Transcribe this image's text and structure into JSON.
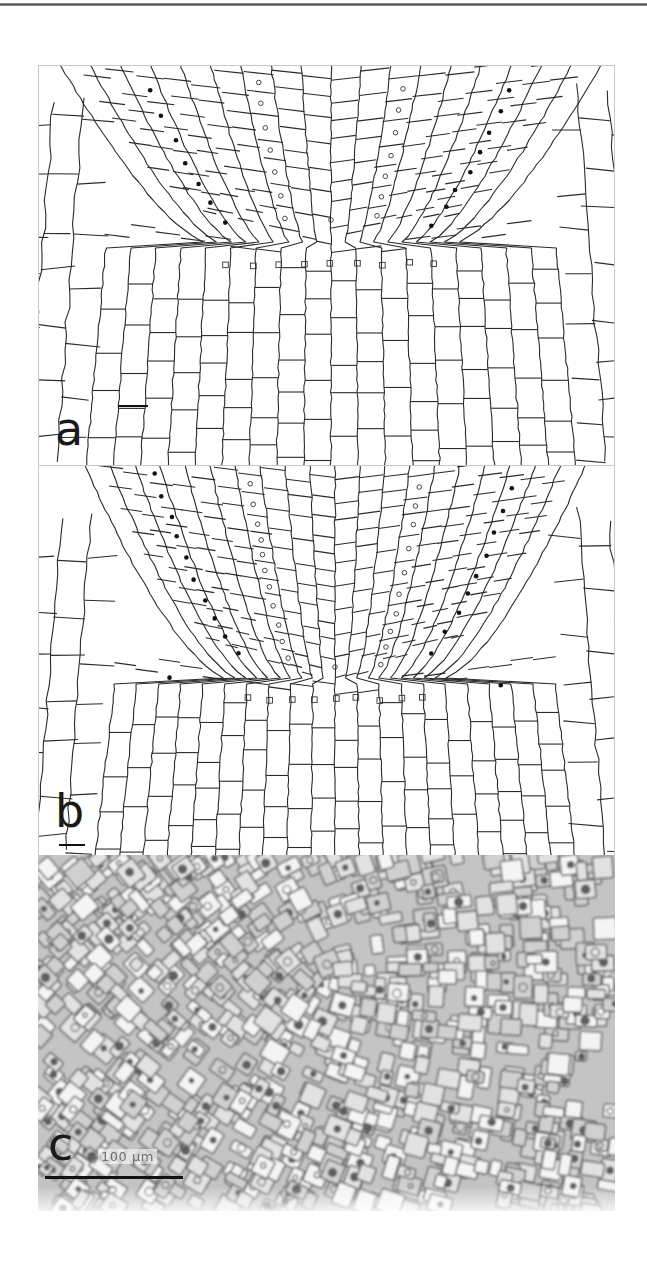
{
  "page": {
    "top_rule_color": "#6a6a6a",
    "background": "#ffffff"
  },
  "figure": {
    "panels": [
      {
        "id": "a",
        "label": "a",
        "type": "line-drawing",
        "description": "Camera lucida drawing of root apex cell pattern",
        "markers": {
          "filled_dot": "black dots marking one cell file",
          "open_circle": "open circles marking a second cell file",
          "open_square": "open squares marking initial cell tier"
        },
        "scale_bar": "short bar, no text"
      },
      {
        "id": "b",
        "label": "b",
        "type": "line-drawing",
        "description": "Camera lucida drawing of root apex cell pattern",
        "markers": {
          "filled_dot": "black dots marking one cell file",
          "open_circle": "open circles marking a second cell file",
          "open_square": "open squares marking initial cell tier"
        },
        "scale_bar": "short bar under label, no text"
      },
      {
        "id": "c",
        "label": "c",
        "type": "micrograph",
        "description": "Grayscale light micrograph of root apex",
        "scale_text": "100 µm",
        "scale_bar": "long bar under scale text"
      }
    ]
  },
  "colors": {
    "line": "#2a2a2a",
    "frame": "#c8c8c8",
    "micrograph_base": "#bdbdbd",
    "micrograph_dark": "#6f6f6f",
    "micrograph_light": "#f2f2f2"
  }
}
